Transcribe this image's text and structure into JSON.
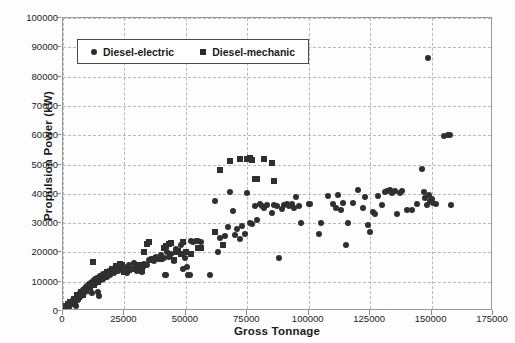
{
  "chart_data": {
    "type": "scatter",
    "title": "",
    "xlabel": "Gross Tonnage",
    "ylabel": "Propulsion Power (kW)",
    "xlim": [
      0,
      175000
    ],
    "ylim": [
      0,
      100000
    ],
    "xticks": [
      0,
      25000,
      50000,
      75000,
      100000,
      125000,
      150000,
      175000
    ],
    "yticks": [
      0,
      10000,
      20000,
      30000,
      40000,
      50000,
      60000,
      70000,
      80000,
      90000,
      100000
    ],
    "xtick_labels": [
      "0",
      "25000",
      "50000",
      "75000",
      "100000",
      "125000",
      "150000",
      "175000"
    ],
    "ytick_labels": [
      "0",
      "10000",
      "20000",
      "30000",
      "40000",
      "50000",
      "60000",
      "70000",
      "80000",
      "90000",
      "100000"
    ],
    "grid": true,
    "grid_style": "dashed",
    "grid_color": "#b9b9b9",
    "marker_color": "#2f2f2f",
    "legend_position": "top-left-inside",
    "series": [
      {
        "name": "Diesel-electric",
        "marker": "circle",
        "color": "#2f2f2f",
        "points": [
          [
            900,
            1200
          ],
          [
            1400,
            1500
          ],
          [
            1800,
            1100
          ],
          [
            2100,
            2000
          ],
          [
            2400,
            1400
          ],
          [
            2700,
            2600
          ],
          [
            3000,
            1900
          ],
          [
            3300,
            3000
          ],
          [
            3600,
            2300
          ],
          [
            3900,
            3600
          ],
          [
            4200,
            2900
          ],
          [
            4500,
            4100
          ],
          [
            4800,
            3400
          ],
          [
            5100,
            4600
          ],
          [
            5400,
            1700
          ],
          [
            5700,
            5000
          ],
          [
            6000,
            3800
          ],
          [
            6300,
            5500
          ],
          [
            6600,
            4400
          ],
          [
            6900,
            6000
          ],
          [
            7200,
            5200
          ],
          [
            7500,
            6600
          ],
          [
            7800,
            5800
          ],
          [
            8100,
            7100
          ],
          [
            8400,
            6300
          ],
          [
            8700,
            7600
          ],
          [
            9000,
            6900
          ],
          [
            9300,
            8100
          ],
          [
            9600,
            7400
          ],
          [
            9900,
            8600
          ],
          [
            10300,
            7900
          ],
          [
            10700,
            9200
          ],
          [
            11100,
            8400
          ],
          [
            11500,
            9700
          ],
          [
            11900,
            6100
          ],
          [
            12300,
            10200
          ],
          [
            12700,
            9000
          ],
          [
            13100,
            10800
          ],
          [
            13500,
            9500
          ],
          [
            14000,
            11300
          ],
          [
            14400,
            6500
          ],
          [
            14800,
            5000
          ],
          [
            15200,
            11900
          ],
          [
            15600,
            10500
          ],
          [
            16200,
            12500
          ],
          [
            16800,
            11100
          ],
          [
            17400,
            13100
          ],
          [
            18000,
            11700
          ],
          [
            18600,
            13700
          ],
          [
            19200,
            12300
          ],
          [
            20000,
            14200
          ],
          [
            20800,
            12900
          ],
          [
            21600,
            14800
          ],
          [
            22400,
            13500
          ],
          [
            23200,
            15400
          ],
          [
            24000,
            14100
          ],
          [
            25000,
            15000
          ],
          [
            26000,
            13000
          ],
          [
            27000,
            15800
          ],
          [
            28000,
            14400
          ],
          [
            29000,
            16400
          ],
          [
            30000,
            13800
          ],
          [
            31000,
            14600
          ],
          [
            31500,
            15200
          ],
          [
            32000,
            13400
          ],
          [
            32500,
            14900
          ],
          [
            33000,
            16000
          ],
          [
            34000,
            15600
          ],
          [
            35000,
            17300
          ],
          [
            36000,
            17900
          ],
          [
            37000,
            17000
          ],
          [
            38000,
            18500
          ],
          [
            39000,
            17600
          ],
          [
            40000,
            19200
          ],
          [
            41000,
            18000
          ],
          [
            41500,
            12200
          ],
          [
            42000,
            12400
          ],
          [
            42500,
            20000
          ],
          [
            43000,
            18400
          ],
          [
            44000,
            19600
          ],
          [
            45000,
            17200
          ],
          [
            46000,
            21000
          ],
          [
            47000,
            20400
          ],
          [
            48000,
            22500
          ],
          [
            49000,
            14500
          ],
          [
            49500,
            18200
          ],
          [
            50000,
            20100
          ],
          [
            50500,
            15000
          ],
          [
            51000,
            12200
          ],
          [
            51500,
            12300
          ],
          [
            52000,
            23800
          ],
          [
            53000,
            23500
          ],
          [
            54000,
            24000
          ],
          [
            55000,
            23900
          ],
          [
            56000,
            23700
          ],
          [
            60000,
            12200
          ],
          [
            62000,
            37700
          ],
          [
            63000,
            20300
          ],
          [
            64000,
            24900
          ],
          [
            66000,
            25500
          ],
          [
            67000,
            28700
          ],
          [
            68000,
            40500
          ],
          [
            69000,
            34200
          ],
          [
            70000,
            26100
          ],
          [
            71000,
            27900
          ],
          [
            72000,
            24700
          ],
          [
            73000,
            29000
          ],
          [
            74000,
            26400
          ],
          [
            75000,
            40300
          ],
          [
            76000,
            30100
          ],
          [
            77000,
            29600
          ],
          [
            78000,
            35800
          ],
          [
            79000,
            31200
          ],
          [
            80000,
            36500
          ],
          [
            81000,
            36000
          ],
          [
            82000,
            35300
          ],
          [
            83000,
            36200
          ],
          [
            85000,
            33600
          ],
          [
            86000,
            36300
          ],
          [
            87000,
            35900
          ],
          [
            88000,
            18000
          ],
          [
            89000,
            34800
          ],
          [
            90000,
            36100
          ],
          [
            91000,
            36400
          ],
          [
            92000,
            35700
          ],
          [
            93000,
            36600
          ],
          [
            94000,
            35200
          ],
          [
            95000,
            38800
          ],
          [
            96000,
            36000
          ],
          [
            97000,
            30000
          ],
          [
            100000,
            36500
          ],
          [
            100500,
            36600
          ],
          [
            104000,
            26400
          ],
          [
            105000,
            30000
          ],
          [
            108000,
            39200
          ],
          [
            110000,
            36500
          ],
          [
            111000,
            35000
          ],
          [
            112000,
            39700
          ],
          [
            113000,
            34600
          ],
          [
            114000,
            36800
          ],
          [
            115000,
            22500
          ],
          [
            116000,
            30100
          ],
          [
            118000,
            36700
          ],
          [
            120000,
            41400
          ],
          [
            122000,
            35000
          ],
          [
            123000,
            39000
          ],
          [
            124000,
            29500
          ],
          [
            125000,
            27000
          ],
          [
            126000,
            33700
          ],
          [
            127000,
            33000
          ],
          [
            128000,
            39200
          ],
          [
            130000,
            36200
          ],
          [
            131000,
            40500
          ],
          [
            132000,
            40800
          ],
          [
            133000,
            41200
          ],
          [
            134000,
            40400
          ],
          [
            135000,
            40900
          ],
          [
            136000,
            33000
          ],
          [
            137000,
            40300
          ],
          [
            138000,
            41000
          ],
          [
            140000,
            34500
          ],
          [
            142000,
            34400
          ],
          [
            144000,
            36400
          ],
          [
            146000,
            48300
          ],
          [
            147000,
            40600
          ],
          [
            147500,
            38500
          ],
          [
            148000,
            36200
          ],
          [
            148500,
            86300
          ],
          [
            149000,
            39600
          ],
          [
            149500,
            37400
          ],
          [
            150000,
            38200
          ],
          [
            150500,
            36900
          ],
          [
            152000,
            36500
          ],
          [
            155000,
            59800
          ],
          [
            156500,
            59900
          ],
          [
            157500,
            60000
          ],
          [
            158000,
            36200
          ]
        ]
      },
      {
        "name": "Diesel-mechanic",
        "marker": "square",
        "color": "#2f2f2f",
        "points": [
          [
            1200,
            1800
          ],
          [
            2000,
            2400
          ],
          [
            2800,
            3200
          ],
          [
            3500,
            2700
          ],
          [
            4300,
            4200
          ],
          [
            5000,
            3500
          ],
          [
            5800,
            5300
          ],
          [
            6500,
            4800
          ],
          [
            7300,
            6400
          ],
          [
            8000,
            5600
          ],
          [
            8800,
            7300
          ],
          [
            9500,
            6800
          ],
          [
            10200,
            8300
          ],
          [
            11000,
            7800
          ],
          [
            11800,
            9400
          ],
          [
            12400,
            16600
          ],
          [
            12600,
            8800
          ],
          [
            13400,
            10400
          ],
          [
            14200,
            9900
          ],
          [
            15000,
            11400
          ],
          [
            15800,
            10800
          ],
          [
            16500,
            12400
          ],
          [
            17300,
            11800
          ],
          [
            18100,
            13400
          ],
          [
            19000,
            12800
          ],
          [
            19800,
            14400
          ],
          [
            20600,
            13800
          ],
          [
            21400,
            15300
          ],
          [
            22200,
            14700
          ],
          [
            23000,
            16200
          ],
          [
            24000,
            15700
          ],
          [
            25000,
            13400
          ],
          [
            26000,
            13600
          ],
          [
            27000,
            14000
          ],
          [
            28000,
            14200
          ],
          [
            29000,
            14400
          ],
          [
            30000,
            14800
          ],
          [
            31000,
            15800
          ],
          [
            32000,
            13500
          ],
          [
            33000,
            20000
          ],
          [
            34000,
            22700
          ],
          [
            35000,
            23500
          ],
          [
            36000,
            17400
          ],
          [
            37000,
            17600
          ],
          [
            38000,
            18000
          ],
          [
            39000,
            18200
          ],
          [
            40000,
            17800
          ],
          [
            41000,
            21600
          ],
          [
            42000,
            22300
          ],
          [
            43000,
            22700
          ],
          [
            44000,
            23200
          ],
          [
            45000,
            17500
          ],
          [
            46000,
            20200
          ],
          [
            47000,
            20400
          ],
          [
            48000,
            19500
          ],
          [
            49000,
            23400
          ],
          [
            50000,
            20000
          ],
          [
            52000,
            19400
          ],
          [
            55000,
            21600
          ],
          [
            56000,
            21500
          ],
          [
            62000,
            27000
          ],
          [
            64000,
            48000
          ],
          [
            65000,
            22400
          ],
          [
            68000,
            51200
          ],
          [
            72000,
            51900
          ],
          [
            75000,
            51800
          ],
          [
            76000,
            52300
          ],
          [
            77000,
            51400
          ],
          [
            78000,
            45200
          ],
          [
            79000,
            45000
          ],
          [
            82000,
            52000
          ],
          [
            85000,
            50600
          ],
          [
            86000,
            44500
          ]
        ]
      }
    ]
  },
  "legend": {
    "entries": [
      {
        "label": "Diesel-electric",
        "marker": "circle"
      },
      {
        "label": "Diesel-mechanic",
        "marker": "square"
      }
    ]
  }
}
